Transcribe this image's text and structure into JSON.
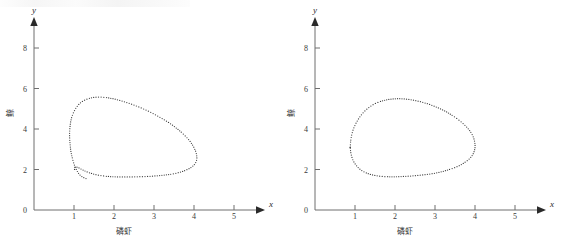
{
  "figure": {
    "background": "#ffffff",
    "ink_color": "#3c3c3c",
    "axis_color": "#6e6e6e",
    "panel_count": 2
  },
  "chart_data": [
    {
      "type": "line",
      "panel": "left",
      "title": "",
      "subtitle": "",
      "xlabel": "磷虾",
      "ylabel": "鲸",
      "x_axis_name": "x",
      "y_axis_name": "y",
      "xlim": [
        0,
        5.6
      ],
      "ylim": [
        0,
        9.0
      ],
      "xticks": [
        0,
        1,
        2,
        3,
        4,
        5
      ],
      "xtick_labels": [
        "0",
        "1",
        "2",
        "3",
        "4",
        "5"
      ],
      "yticks": [
        0,
        2,
        4,
        6,
        8
      ],
      "ytick_labels": [
        "0",
        "2",
        "4",
        "6",
        "8"
      ],
      "grid": false,
      "legend": false,
      "marker": "dotted",
      "annotation": "outward spiral trajectory approaching limit cycle",
      "series": [
        {
          "name": "trajectory",
          "x": [
            1.3,
            1.22,
            1.14,
            1.07,
            1.01,
            0.96,
            0.92,
            0.9,
            0.89,
            0.9,
            0.93,
            0.99,
            1.08,
            1.2,
            1.36,
            1.55,
            1.78,
            2.03,
            2.3,
            2.58,
            2.86,
            3.13,
            3.38,
            3.6,
            3.78,
            3.92,
            4.01,
            4.06,
            4.07,
            4.03,
            3.94,
            3.8,
            3.62,
            3.4,
            3.14,
            2.86,
            2.56,
            2.27,
            1.99,
            1.74,
            1.52,
            1.34,
            1.2,
            1.1,
            1.04,
            1.01,
            1.02
          ],
          "y": [
            1.55,
            1.62,
            1.75,
            1.95,
            2.22,
            2.55,
            2.92,
            3.3,
            3.7,
            4.1,
            4.48,
            4.82,
            5.12,
            5.35,
            5.5,
            5.57,
            5.56,
            5.47,
            5.32,
            5.12,
            4.88,
            4.6,
            4.3,
            3.98,
            3.66,
            3.34,
            3.04,
            2.77,
            2.52,
            2.3,
            2.12,
            1.97,
            1.85,
            1.76,
            1.7,
            1.66,
            1.64,
            1.63,
            1.64,
            1.68,
            1.76,
            1.87,
            2.0,
            2.1,
            2.12,
            2.06,
            1.95
          ]
        }
      ]
    },
    {
      "type": "line",
      "panel": "right",
      "title": "",
      "subtitle": "",
      "xlabel": "磷虾",
      "ylabel": "鲸",
      "x_axis_name": "x",
      "y_axis_name": "y",
      "xlim": [
        0,
        5.6
      ],
      "ylim": [
        0,
        9.0
      ],
      "xticks": [
        0,
        1,
        2,
        3,
        4,
        5
      ],
      "xtick_labels": [
        "0",
        "1",
        "2",
        "3",
        "4",
        "5"
      ],
      "yticks": [
        0,
        2,
        4,
        6,
        8
      ],
      "ytick_labels": [
        "0",
        "2",
        "4",
        "6",
        "8"
      ],
      "grid": false,
      "legend": false,
      "marker": "dotted",
      "annotation": "closed limit cycle",
      "series": [
        {
          "name": "limit-cycle",
          "x": [
            0.88,
            0.9,
            0.95,
            1.04,
            1.16,
            1.32,
            1.51,
            1.74,
            1.99,
            2.25,
            2.52,
            2.79,
            3.05,
            3.29,
            3.5,
            3.69,
            3.84,
            3.94,
            3.99,
            4.0,
            3.96,
            3.87,
            3.73,
            3.55,
            3.33,
            3.08,
            2.81,
            2.53,
            2.25,
            1.98,
            1.73,
            1.51,
            1.32,
            1.16,
            1.04,
            0.95,
            0.9,
            0.88
          ],
          "y": [
            3.1,
            3.52,
            3.94,
            4.34,
            4.7,
            5.02,
            5.26,
            5.42,
            5.49,
            5.48,
            5.4,
            5.26,
            5.07,
            4.84,
            4.58,
            4.29,
            3.99,
            3.68,
            3.38,
            3.08,
            2.8,
            2.55,
            2.33,
            2.14,
            1.98,
            1.85,
            1.76,
            1.7,
            1.66,
            1.64,
            1.65,
            1.7,
            1.8,
            1.96,
            2.18,
            2.46,
            2.78,
            3.1
          ]
        }
      ]
    }
  ],
  "labels": {
    "x_axis_name": "x",
    "y_axis_name": "y",
    "x_axis_cjk": "磷虾",
    "y_axis_cjk": "鲸",
    "ticks_x": [
      "0",
      "1",
      "2",
      "3",
      "4",
      "5"
    ],
    "ticks_y": [
      "0",
      "2",
      "4",
      "6",
      "8"
    ]
  }
}
